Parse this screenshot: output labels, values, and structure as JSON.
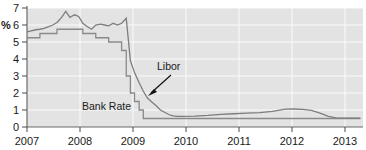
{
  "chart_data": {
    "type": "line",
    "title": "",
    "xlabel": "",
    "ylabel": "%",
    "ylim": [
      0,
      7
    ],
    "xlim": [
      2007,
      2013.5
    ],
    "grid": true,
    "legend_position": "inline-annotations",
    "y_ticks": [
      "0",
      "1",
      "2",
      "3",
      "4",
      "5",
      "6",
      "7"
    ],
    "x_ticks": [
      "2007",
      "2008",
      "2009",
      "2010",
      "2011",
      "2012",
      "2013"
    ],
    "annotations": [
      {
        "text": "Libor",
        "x": 2009.55,
        "y": 2.55
      },
      {
        "text": "Bank Rate",
        "x": 2008.45,
        "y": 1.15
      }
    ],
    "series": [
      {
        "name": "Libor",
        "style": "smooth",
        "color": "#7d7d7d",
        "x": [
          2007.0,
          2007.08,
          2007.17,
          2007.25,
          2007.33,
          2007.42,
          2007.5,
          2007.58,
          2007.67,
          2007.75,
          2007.83,
          2007.92,
          2008.0,
          2008.08,
          2008.17,
          2008.25,
          2008.33,
          2008.42,
          2008.5,
          2008.58,
          2008.67,
          2008.75,
          2008.83,
          2008.92,
          2009.0,
          2009.08,
          2009.17,
          2009.25,
          2009.33,
          2009.42,
          2009.5,
          2009.58,
          2009.67,
          2009.75,
          2009.83,
          2009.92,
          2010.0,
          2010.25,
          2010.5,
          2010.75,
          2011.0,
          2011.25,
          2011.5,
          2011.75,
          2012.0,
          2012.17,
          2012.33,
          2012.5,
          2012.67,
          2012.83,
          2013.0,
          2013.25,
          2013.45
        ],
        "values": [
          5.6,
          5.65,
          5.72,
          5.75,
          5.8,
          5.9,
          6.0,
          6.15,
          6.45,
          6.8,
          6.45,
          6.6,
          6.5,
          6.1,
          5.9,
          5.75,
          6.0,
          6.05,
          6.0,
          5.95,
          6.1,
          6.0,
          6.1,
          6.4,
          3.9,
          3.2,
          2.6,
          2.1,
          1.7,
          1.45,
          1.25,
          1.0,
          0.85,
          0.72,
          0.65,
          0.62,
          0.62,
          0.64,
          0.68,
          0.74,
          0.78,
          0.82,
          0.85,
          0.92,
          1.05,
          1.06,
          1.04,
          0.98,
          0.82,
          0.62,
          0.52,
          0.52,
          0.52
        ]
      },
      {
        "name": "Bank Rate",
        "style": "step",
        "color": "#8a8a8a",
        "x": [
          2007.0,
          2007.08,
          2007.25,
          2007.42,
          2007.58,
          2007.92,
          2008.08,
          2008.33,
          2008.58,
          2008.75,
          2008.83,
          2008.92,
          2009.0,
          2009.08,
          2009.17,
          2009.25,
          2009.33,
          2013.45
        ],
        "values": [
          5.25,
          5.25,
          5.5,
          5.5,
          5.75,
          5.75,
          5.5,
          5.25,
          5.0,
          5.0,
          4.5,
          3.0,
          2.0,
          1.5,
          1.0,
          0.5,
          0.5,
          0.5
        ]
      }
    ]
  }
}
